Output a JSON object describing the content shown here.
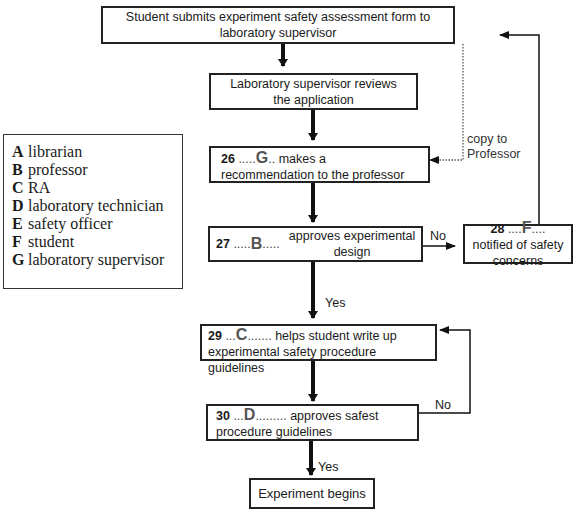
{
  "legend": {
    "items": [
      {
        "key": "A",
        "label": "librarian"
      },
      {
        "key": "B",
        "label": "professor"
      },
      {
        "key": "C",
        "label": "RA"
      },
      {
        "key": "D",
        "label": "laboratory technician"
      },
      {
        "key": "E",
        "label": "safety officer"
      },
      {
        "key": "F",
        "label": "student"
      },
      {
        "key": "G",
        "label": "laboratory supervisor"
      }
    ]
  },
  "flowchart": {
    "start": "Student submits experiment safety assessment form to laboratory supervisor",
    "review": "Laboratory supervisor reviews the application",
    "q26": {
      "number": "26",
      "answer": "G",
      "text": "makes a recommendation to the professor"
    },
    "q27": {
      "number": "27",
      "answer": "B",
      "text": "approves experimental design"
    },
    "q28": {
      "number": "28",
      "answer": "F",
      "text": "notified of safety concerns"
    },
    "q29": {
      "number": "29",
      "answer": "C",
      "text": "helps student write up experimental safety procedure guidelines"
    },
    "q30": {
      "number": "30",
      "answer": "D",
      "text": "approves safest procedure guidelines"
    },
    "end": "Experiment begins",
    "labels": {
      "copy_to_1": "copy to",
      "copy_to_2": "Professor",
      "no_27": "No",
      "yes_27": "Yes",
      "no_30": "No",
      "yes_30": "Yes"
    }
  }
}
